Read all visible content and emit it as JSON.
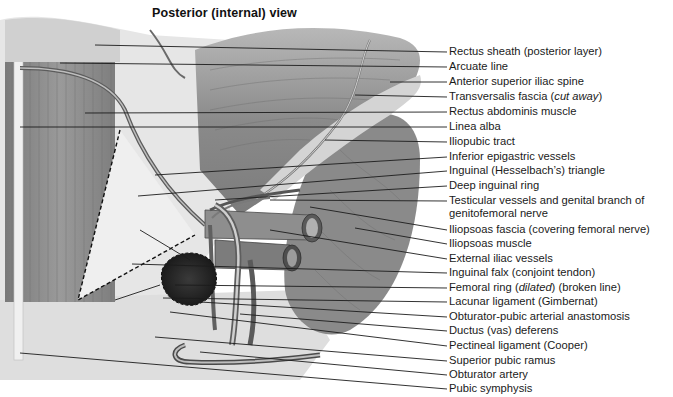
{
  "title": "Posterior (internal) view",
  "colors": {
    "background": "#ffffff",
    "text": "#1a1a1a",
    "leader_line": "#1c1c1c",
    "muscle_dark": "#6e6e6e",
    "muscle_mid": "#8c8c8c",
    "fascia_light": "#e4e4e4",
    "vessel": "#a8a8a8",
    "femoral_ring": "#2a2a2a"
  },
  "labels": [
    {
      "id": "rectus-sheath",
      "text": "Rectus sheath (posterior layer)",
      "y": 52,
      "from": [
        95,
        45
      ]
    },
    {
      "id": "arcuate-line",
      "text": "Arcuate line",
      "y": 67,
      "from": [
        60,
        63
      ]
    },
    {
      "id": "anterior-superior-iliac-spine",
      "text": "Anterior superior iliac spine",
      "y": 82,
      "from": [
        390,
        82
      ]
    },
    {
      "id": "transversalis-fascia",
      "text": "Transversalis fascia",
      "italic_suffix": "cut away",
      "y": 97,
      "from": [
        355,
        95
      ]
    },
    {
      "id": "rectus-abdominis-muscle",
      "text": "Rectus abdominis muscle",
      "y": 112,
      "from": [
        85,
        113
      ]
    },
    {
      "id": "linea-alba",
      "text": "Linea alba",
      "y": 127,
      "from": [
        20,
        127
      ]
    },
    {
      "id": "iliopubic-tract",
      "text": "Iliopubic tract",
      "y": 142,
      "from": [
        325,
        140
      ]
    },
    {
      "id": "inferior-epigastric-vessels",
      "text": "Inferior epigastric vessels",
      "y": 157,
      "from": [
        155,
        175
      ]
    },
    {
      "id": "inguinal-triangle",
      "text": "Inguinal (Hesselbach’s) triangle",
      "y": 171,
      "from": [
        138,
        196
      ]
    },
    {
      "id": "deep-inguinal-ring",
      "text": "Deep inguinal ring",
      "y": 186,
      "from": [
        215,
        200
      ]
    },
    {
      "id": "testicular-vessels",
      "text": "Testicular vessels and genital branch of",
      "text_line2": "genitofemoral nerve",
      "y": 201,
      "from": [
        270,
        200
      ]
    },
    {
      "id": "iliopsoas-fascia",
      "text": "Iliopsoas fascia (covering femoral nerve)",
      "y": 230,
      "from": [
        310,
        207
      ]
    },
    {
      "id": "iliopsoas-muscle",
      "text": "Iliopsoas muscle",
      "y": 244,
      "from": [
        355,
        228
      ]
    },
    {
      "id": "external-iliac-vessels",
      "text": "External iliac vessels",
      "y": 259,
      "from": [
        270,
        230
      ]
    },
    {
      "id": "inguinal-falx",
      "text": "Inguinal falx (conjoint tendon)",
      "y": 273,
      "from": [
        132,
        264
      ]
    },
    {
      "id": "femoral-ring",
      "text": "Femoral ring",
      "italic_mid": "dilated",
      "text_suffix": "(broken line)",
      "y": 288,
      "from": [
        175,
        285
      ]
    },
    {
      "id": "lacunar-ligament",
      "text": "Lacunar ligament (Gimbernat)",
      "y": 302,
      "from": [
        163,
        298
      ]
    },
    {
      "id": "obturator-pubic-anastomosis",
      "text": "Obturator-pubic arterial anastomosis",
      "y": 317,
      "from": [
        200,
        302
      ]
    },
    {
      "id": "ductus-deferens",
      "text": "Ductus (vas) deferens",
      "y": 331,
      "from": [
        240,
        314
      ]
    },
    {
      "id": "pectineal-ligament",
      "text": "Pectineal ligament (Cooper)",
      "y": 346,
      "from": [
        170,
        312
      ]
    },
    {
      "id": "superior-pubic-ramus",
      "text": "Superior pubic ramus",
      "y": 361,
      "from": [
        155,
        337
      ]
    },
    {
      "id": "obturator-artery",
      "text": "Obturator artery",
      "y": 375,
      "from": [
        200,
        352
      ]
    },
    {
      "id": "pubic-symphysis",
      "text": "Pubic symphysis",
      "y": 389,
      "from": [
        20,
        353
      ]
    }
  ]
}
